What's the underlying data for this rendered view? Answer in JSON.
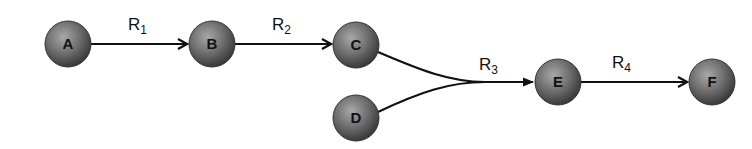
{
  "diagram": {
    "nodes": [
      {
        "id": "A",
        "label": "A",
        "cx": 68,
        "cy": 44
      },
      {
        "id": "B",
        "label": "B",
        "cx": 212,
        "cy": 44
      },
      {
        "id": "C",
        "label": "C",
        "cx": 356,
        "cy": 45
      },
      {
        "id": "D",
        "label": "D",
        "cx": 356,
        "cy": 118
      },
      {
        "id": "E",
        "label": "E",
        "cx": 558,
        "cy": 82
      },
      {
        "id": "F",
        "label": "F",
        "cx": 712,
        "cy": 82
      }
    ],
    "node_radius": 23,
    "node_color": "#6e6e6e",
    "edges": [
      {
        "from": "A",
        "to": "B",
        "rate": "R",
        "sub": "1"
      },
      {
        "from": "B",
        "to": "C",
        "rate": "R",
        "sub": "2"
      },
      {
        "from": "C+D",
        "to": "E",
        "rate": "R",
        "sub": "3"
      },
      {
        "from": "E",
        "to": "F",
        "rate": "R",
        "sub": "4"
      }
    ]
  }
}
